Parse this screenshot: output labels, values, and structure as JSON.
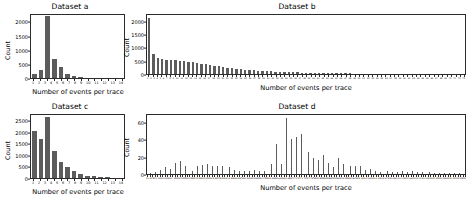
{
  "figure": {
    "background": "#ffffff",
    "bar_color": "#5c5c5c",
    "axis_color": "#2b2b2b"
  },
  "common": {
    "xlabel": "Number of events per trace",
    "ylabel": "Count"
  },
  "chart_data": [
    {
      "type": "bar",
      "title": "Dataset a",
      "xlabel": "Number of events per trace",
      "ylabel": "Count",
      "ylim": [
        0,
        2300
      ],
      "yticks": [
        0,
        500,
        1000,
        1500,
        2000
      ],
      "ytick_labels": [
        "0",
        "500",
        "1000",
        "1500",
        "2000"
      ],
      "grid": false,
      "legend": "none",
      "categories": [
        "1",
        "2",
        "3",
        "4",
        "5",
        "6",
        "7",
        "8",
        "9",
        "10",
        "11",
        "12",
        "13",
        "14"
      ],
      "values": [
        130,
        300,
        2250,
        700,
        390,
        150,
        60,
        30,
        18,
        12,
        8,
        6,
        4,
        3
      ]
    },
    {
      "type": "bar",
      "title": "Dataset b",
      "xlabel": "Number of events per trace",
      "ylabel": "Count",
      "ylim": [
        0,
        2300
      ],
      "yticks": [
        0,
        500,
        1000,
        1500,
        2000
      ],
      "ytick_labels": [
        "0",
        "500",
        "1000",
        "1500",
        "2000"
      ],
      "grid": false,
      "legend": "none",
      "categories": [
        "1",
        "2",
        "3",
        "4",
        "5",
        "6",
        "7",
        "8",
        "9",
        "10",
        "11",
        "12",
        "13",
        "14",
        "15",
        "16",
        "17",
        "18",
        "19",
        "20",
        "21",
        "22",
        "23",
        "24",
        "25",
        "26",
        "27",
        "28",
        "29",
        "30",
        "31",
        "32",
        "33",
        "34",
        "35",
        "36",
        "37",
        "38",
        "39",
        "40",
        "41",
        "42",
        "43",
        "44",
        "45",
        "46",
        "47",
        "48",
        "49",
        "50",
        "51",
        "52",
        "53",
        "54",
        "55",
        "56",
        "57",
        "58",
        "59",
        "60",
        "61",
        "62",
        "63",
        "64",
        "65",
        "66",
        "67",
        "68",
        "69",
        "70",
        "71",
        "72",
        "73"
      ],
      "values": [
        2200,
        790,
        610,
        570,
        560,
        540,
        530,
        520,
        500,
        480,
        450,
        430,
        400,
        380,
        370,
        330,
        300,
        280,
        250,
        230,
        210,
        190,
        170,
        155,
        140,
        130,
        120,
        110,
        100,
        95,
        88,
        80,
        72,
        66,
        60,
        55,
        50,
        46,
        42,
        38,
        35,
        32,
        29,
        27,
        25,
        23,
        21,
        19,
        18,
        16,
        15,
        14,
        13,
        12,
        11,
        10,
        9,
        9,
        8,
        8,
        7,
        7,
        6,
        6,
        5,
        5,
        5,
        4,
        4,
        4,
        3,
        3,
        3
      ]
    },
    {
      "type": "bar",
      "title": "Dataset c",
      "xlabel": "Number of events per trace",
      "ylabel": "Count",
      "ylim": [
        0,
        2800
      ],
      "yticks": [
        0,
        500,
        1000,
        1500,
        2000,
        2500
      ],
      "ytick_labels": [
        "0",
        "500",
        "1000",
        "1500",
        "2000",
        "2500"
      ],
      "grid": false,
      "legend": "none",
      "categories": [
        "1",
        "2",
        "3",
        "4",
        "5",
        "6",
        "7",
        "8",
        "9",
        "10",
        "11",
        "12",
        "13",
        "14"
      ],
      "values": [
        2100,
        1750,
        2700,
        1200,
        700,
        480,
        300,
        180,
        110,
        70,
        45,
        30,
        20,
        12
      ]
    },
    {
      "type": "bar",
      "title": "Dataset d",
      "xlabel": "Number of events per trace",
      "ylabel": "Count",
      "ylim": [
        0,
        70
      ],
      "yticks": [
        0,
        20,
        40,
        60
      ],
      "ytick_labels": [
        "0",
        "20",
        "40",
        "60"
      ],
      "grid": false,
      "legend": "none",
      "categories": [
        "2",
        "3",
        "4",
        "5",
        "6",
        "7",
        "8",
        "9",
        "10",
        "11",
        "12",
        "13",
        "14",
        "15",
        "16",
        "17",
        "18",
        "19",
        "20",
        "21",
        "22",
        "23",
        "24",
        "25",
        "26",
        "27",
        "28",
        "29",
        "30",
        "31",
        "32",
        "33",
        "34",
        "35",
        "36",
        "37",
        "38",
        "39",
        "40",
        "41",
        "42",
        "43",
        "44",
        "45",
        "46",
        "47",
        "48",
        "49",
        "50",
        "51",
        "52",
        "53",
        "54",
        "55",
        "56",
        "57",
        "58",
        "59",
        "60",
        "61",
        "62",
        "63",
        "64",
        "65",
        "66",
        "67",
        "68",
        "69",
        "70",
        "71",
        "72",
        "73",
        "74",
        "75",
        "76",
        "77",
        "78",
        "79",
        "80",
        "81",
        "82",
        "83",
        "84",
        "85",
        "86",
        "87",
        "88",
        "89",
        "90",
        "91",
        "92",
        "93",
        "94",
        "95",
        "96",
        "97",
        "98",
        "99",
        "100",
        "101",
        "102",
        "103",
        "104",
        "105",
        "106",
        "107",
        "108",
        "109",
        "110",
        "111",
        "112",
        "113",
        "114",
        "115",
        "116",
        "117",
        "118",
        "119",
        "120",
        "121",
        "122",
        "123",
        "124",
        "125",
        "126",
        "127",
        "128",
        "129",
        "130"
      ],
      "values": [
        1,
        1,
        2,
        2,
        3,
        5,
        7,
        8,
        10,
        6,
        5,
        13,
        15,
        16,
        14,
        9,
        7,
        5,
        3,
        2,
        9,
        10,
        11,
        9,
        12,
        11,
        10,
        8,
        9,
        10,
        9,
        8,
        7,
        8,
        6,
        5,
        4,
        4,
        3,
        3,
        3,
        4,
        5,
        5,
        4,
        4,
        3,
        3,
        13,
        17,
        12,
        22,
        36,
        14,
        12,
        18,
        67,
        26,
        41,
        24,
        44,
        29,
        47,
        46,
        37,
        26,
        26,
        19,
        18,
        17,
        13,
        22,
        21,
        13,
        17,
        8,
        14,
        19,
        12,
        12,
        14,
        9,
        10,
        8,
        9,
        7,
        10,
        7,
        5,
        4,
        6,
        3,
        3,
        2,
        2,
        3,
        2,
        3,
        2,
        2,
        1,
        2,
        2,
        3,
        3,
        2,
        2,
        3,
        2,
        2,
        1,
        2,
        1,
        2,
        2,
        1,
        1,
        2,
        1,
        1,
        1,
        1,
        1,
        1,
        1,
        1,
        1,
        1,
        1
      ]
    }
  ]
}
